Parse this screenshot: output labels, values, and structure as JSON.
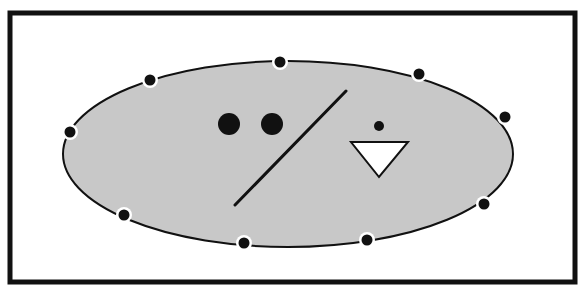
{
  "diagram": {
    "colors": {
      "background": "#ffffff",
      "frame": "#111111",
      "ellipse_fill": "#c8c8c8",
      "ellipse_stroke": "#111111",
      "marks": "#111111",
      "triangle_fill": "#ffffff"
    },
    "frame": {
      "x": 10,
      "y": 13,
      "width": 565,
      "height": 269,
      "stroke_width": 5
    },
    "ellipse": {
      "cx": 288,
      "cy": 154,
      "rx": 225,
      "ry": 93
    },
    "boundary_dots": [
      {
        "x": 150,
        "y": 80
      },
      {
        "x": 280,
        "y": 62
      },
      {
        "x": 419,
        "y": 74
      },
      {
        "x": 505,
        "y": 117
      },
      {
        "x": 484,
        "y": 204
      },
      {
        "x": 367,
        "y": 240
      },
      {
        "x": 244,
        "y": 243
      },
      {
        "x": 124,
        "y": 215
      },
      {
        "x": 70,
        "y": 132
      }
    ],
    "large_dots": [
      {
        "x": 229,
        "y": 124,
        "r": 11
      },
      {
        "x": 272,
        "y": 124,
        "r": 11
      }
    ],
    "slash_line": {
      "x1": 235,
      "y1": 205,
      "x2": 346,
      "y2": 91
    },
    "small_dot": {
      "x": 379,
      "y": 126,
      "r": 5
    },
    "triangle": {
      "points": "351,142 408,142 379,177",
      "direction": "down"
    }
  }
}
